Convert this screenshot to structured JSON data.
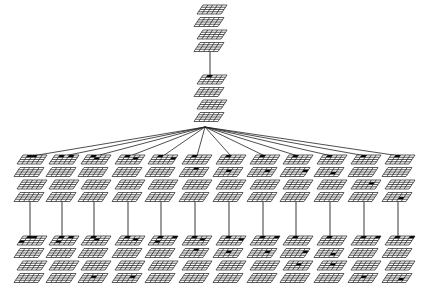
{
  "diagram": {
    "grid": {
      "layers": 4,
      "rows": 4,
      "cols": 5,
      "line_color": "#1a1a1a",
      "fill_color": "#000000",
      "bg_color": "#ffffff"
    },
    "root": {
      "id": "root",
      "cx": 212,
      "top": 5
    },
    "level1": {
      "id": "level1",
      "cx": 212,
      "top": 75
    },
    "fan_origin": {
      "x": 205,
      "y": 127
    },
    "children": [
      {
        "id": "c1",
        "cx": 32,
        "marks": [
          [
            0,
            0,
            1
          ],
          [
            0,
            0,
            2
          ]
        ]
      },
      {
        "id": "c2",
        "cx": 64,
        "marks": [
          [
            0,
            0,
            1
          ],
          [
            0,
            0,
            3
          ]
        ]
      },
      {
        "id": "c3",
        "cx": 96,
        "marks": [
          [
            0,
            0,
            1
          ],
          [
            0,
            1,
            2
          ]
        ]
      },
      {
        "id": "c4",
        "cx": 130,
        "marks": [
          [
            0,
            0,
            1
          ],
          [
            0,
            1,
            3
          ]
        ]
      },
      {
        "id": "c5",
        "cx": 163,
        "marks": [
          [
            0,
            0,
            1
          ],
          [
            0,
            1,
            4
          ]
        ]
      },
      {
        "id": "c6",
        "cx": 197,
        "marks": [
          [
            0,
            0,
            1
          ],
          [
            1,
            0,
            2
          ]
        ]
      },
      {
        "id": "c7",
        "cx": 231,
        "marks": [
          [
            0,
            0,
            1
          ],
          [
            1,
            1,
            2
          ]
        ]
      },
      {
        "id": "c8",
        "cx": 265,
        "marks": [
          [
            0,
            0,
            1
          ],
          [
            1,
            1,
            3
          ]
        ]
      },
      {
        "id": "c9",
        "cx": 298,
        "marks": [
          [
            0,
            0,
            1
          ],
          [
            1,
            1,
            4
          ]
        ]
      },
      {
        "id": "c10",
        "cx": 332,
        "marks": [
          [
            0,
            0,
            1
          ],
          [
            1,
            2,
            3
          ]
        ]
      },
      {
        "id": "c11",
        "cx": 366,
        "marks": [
          [
            0,
            0,
            1
          ],
          [
            2,
            1,
            3
          ]
        ]
      },
      {
        "id": "c12",
        "cx": 400,
        "marks": [
          [
            0,
            0,
            1
          ],
          [
            3,
            2,
            3
          ]
        ]
      }
    ],
    "grandchildren": [
      {
        "id": "g1",
        "marks": [
          [
            0,
            0,
            1
          ],
          [
            0,
            0,
            2
          ],
          [
            0,
            2,
            0
          ]
        ]
      },
      {
        "id": "g2",
        "marks": [
          [
            0,
            0,
            1
          ],
          [
            0,
            0,
            3
          ],
          [
            0,
            2,
            1
          ]
        ]
      },
      {
        "id": "g3",
        "marks": [
          [
            0,
            0,
            1
          ],
          [
            0,
            1,
            2
          ],
          [
            3,
            1,
            2
          ]
        ]
      },
      {
        "id": "g4",
        "marks": [
          [
            0,
            0,
            1
          ],
          [
            0,
            1,
            3
          ],
          [
            3,
            1,
            3
          ]
        ]
      },
      {
        "id": "g5",
        "marks": [
          [
            0,
            0,
            1
          ],
          [
            0,
            0,
            4
          ],
          [
            0,
            2,
            1
          ]
        ]
      },
      {
        "id": "g6",
        "marks": [
          [
            0,
            0,
            1
          ],
          [
            0,
            1,
            3
          ],
          [
            1,
            0,
            2
          ]
        ]
      },
      {
        "id": "g7",
        "marks": [
          [
            0,
            0,
            1
          ],
          [
            1,
            1,
            2
          ],
          [
            0,
            1,
            4
          ]
        ]
      },
      {
        "id": "g8",
        "marks": [
          [
            0,
            0,
            1
          ],
          [
            1,
            1,
            3
          ],
          [
            0,
            0,
            4
          ]
        ]
      },
      {
        "id": "g9",
        "marks": [
          [
            0,
            0,
            1
          ],
          [
            1,
            1,
            4
          ],
          [
            2,
            1,
            2
          ]
        ]
      },
      {
        "id": "g10",
        "marks": [
          [
            0,
            0,
            1
          ],
          [
            1,
            2,
            3
          ],
          [
            2,
            1,
            2
          ]
        ]
      },
      {
        "id": "g11",
        "marks": [
          [
            0,
            0,
            1
          ],
          [
            0,
            0,
            4
          ],
          [
            3,
            1,
            2
          ]
        ]
      },
      {
        "id": "g12",
        "marks": [
          [
            0,
            0,
            1
          ],
          [
            0,
            0,
            4
          ],
          [
            3,
            2,
            3
          ]
        ]
      }
    ],
    "layout": {
      "children_top": 155,
      "grand_top": 236,
      "layer_step": 12.5,
      "grid_w": 24,
      "grid_h": 9,
      "skew": 6,
      "zig": 3
    }
  }
}
